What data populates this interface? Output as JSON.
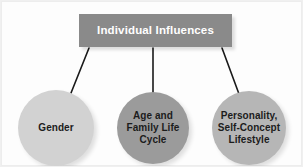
{
  "diagram": {
    "type": "hierarchy",
    "title": "Individual Influences",
    "header": {
      "label": "Individual Influences",
      "fill_color": "#8a8a8a",
      "text_color": "#ffffff"
    },
    "background_color": "#fdfdfd",
    "connector_color": "#1a1a1a",
    "nodes": [
      {
        "id": "gender",
        "label": "Gender",
        "fill_color": "#d2d2d2",
        "text_color": "#1c1c1c"
      },
      {
        "id": "age-family-life-cycle",
        "label": "Age and\nFamily Life\nCycle",
        "fill_color": "#9b9b9b",
        "text_color": "#1c1c1c"
      },
      {
        "id": "personality-self-concept-lifestyle",
        "label": "Personality,\nSelf-Concept\nLifestyle",
        "fill_color": "#b6b6b6",
        "text_color": "#1c1c1c"
      }
    ],
    "connectors": [
      {
        "id": "header-to-gender",
        "from": "header",
        "to": "gender"
      },
      {
        "id": "header-to-age-family",
        "from": "header",
        "to": "age-family-life-cycle"
      },
      {
        "id": "header-to-personality",
        "from": "header",
        "to": "personality-self-concept-lifestyle"
      }
    ]
  }
}
